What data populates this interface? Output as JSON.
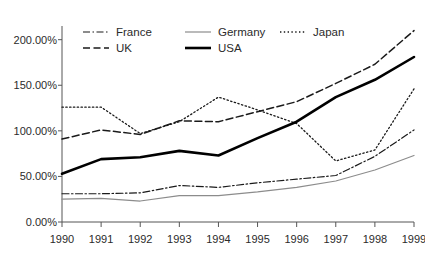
{
  "chart_data": {
    "type": "line",
    "title": "",
    "subtitle": "",
    "xlabel": "",
    "ylabel": "",
    "x": [
      1990,
      1991,
      1992,
      1993,
      1994,
      1995,
      1996,
      1997,
      1998,
      1999
    ],
    "categories": [
      "1990",
      "1991",
      "1992",
      "1993",
      "1994",
      "1995",
      "1996",
      "1997",
      "1998",
      "1999"
    ],
    "xtick_labels": [
      "1990",
      "1991",
      "1992",
      "1993",
      "1994",
      "1995",
      "1996",
      "1997",
      "1998",
      "1999"
    ],
    "ytick_labels": [
      "0.00%",
      "50.00%",
      "100.00%",
      "150.00%",
      "200.00%"
    ],
    "ytick_values": [
      0,
      50,
      100,
      150,
      200
    ],
    "ylim": [
      0,
      215
    ],
    "xlim": [
      1990,
      1999
    ],
    "grid": false,
    "legend_position": "top-left-inside",
    "series": [
      {
        "name": "France",
        "label": "France",
        "style": "dash-dot",
        "color": "#1a1a1a",
        "width": 1.2,
        "values": [
          31,
          31,
          32,
          40,
          38,
          43,
          47,
          51,
          72,
          101
        ]
      },
      {
        "name": "Germany",
        "label": "Germany",
        "style": "solid-thin",
        "color": "#8c8c8c",
        "width": 1.2,
        "values": [
          25,
          26,
          23,
          29,
          29,
          33,
          38,
          45,
          57,
          73
        ]
      },
      {
        "name": "Japan",
        "label": "Japan",
        "style": "dotted",
        "color": "#1a1a1a",
        "width": 1.3,
        "values": [
          126,
          126,
          97,
          110,
          137,
          123,
          108,
          67,
          79,
          146
        ]
      },
      {
        "name": "UK",
        "label": "UK",
        "style": "dashed",
        "color": "#1a1a1a",
        "width": 1.5,
        "values": [
          91,
          101,
          96,
          111,
          110,
          121,
          132,
          152,
          173,
          210
        ]
      },
      {
        "name": "USA",
        "label": "USA",
        "style": "solid-thick",
        "color": "#000000",
        "width": 2.6,
        "values": [
          53,
          69,
          71,
          78,
          73,
          92,
          110,
          137,
          156,
          181
        ]
      }
    ]
  },
  "legend": {
    "entries": [
      {
        "label": "France",
        "row": 0,
        "col": 0
      },
      {
        "label": "Germany",
        "row": 0,
        "col": 1
      },
      {
        "label": "Japan",
        "row": 0,
        "col": 2
      },
      {
        "label": "UK",
        "row": 1,
        "col": 0
      },
      {
        "label": "USA",
        "row": 1,
        "col": 1
      }
    ]
  }
}
